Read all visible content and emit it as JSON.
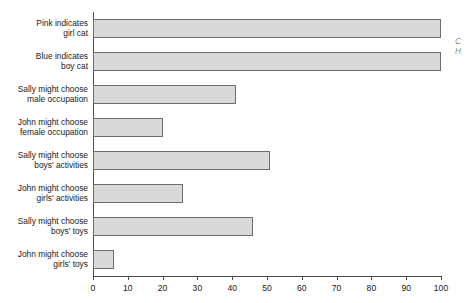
{
  "chart_data": {
    "type": "bar",
    "orientation": "horizontal",
    "title": "",
    "subtitle": "",
    "xlabel": "",
    "ylabel": "",
    "xlim": [
      0,
      100
    ],
    "xticks": [
      0,
      10,
      20,
      30,
      40,
      50,
      60,
      70,
      80,
      90,
      100
    ],
    "grid": false,
    "legend": null,
    "bar_fill_color": "#d9d9d9",
    "bar_border_color": "#6e6e6e",
    "axis_color": "#4d4d4d",
    "categories": [
      "Pink indicates\ngirl cat",
      "Blue indicates\nboy cat",
      "Sally might choose\nmale occupation",
      "John might choose\nfemale occupation",
      "Sally might choose\nboys' activities",
      "John might choose\ngirls' activities",
      "Sally might choose\nboys' toys",
      "John might choose\ngirls' toys"
    ],
    "values": [
      100,
      100,
      41,
      20,
      51,
      26,
      46,
      6
    ]
  },
  "edge_note": {
    "text": "C\nH"
  }
}
